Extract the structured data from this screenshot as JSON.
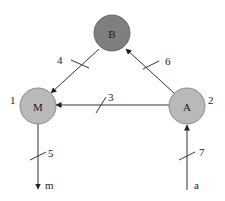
{
  "colors": {
    "node_dark": "#7f7f7f",
    "node_light": "#b9b9b9",
    "stroke": "#333333",
    "background": "#ffffff"
  },
  "nodes": {
    "B": {
      "label": "B",
      "index": ""
    },
    "M": {
      "label": "M",
      "index": "1"
    },
    "A": {
      "label": "A",
      "index": "2"
    }
  },
  "edges": {
    "e4": {
      "from": "B",
      "to": "M",
      "label": "4"
    },
    "e6": {
      "from": "A",
      "to": "B",
      "label": "6"
    },
    "e3": {
      "from": "A",
      "to": "M",
      "label": "3"
    },
    "e5": {
      "from": "M",
      "to": "m",
      "label": "5"
    },
    "e7": {
      "from": "a",
      "to": "A",
      "label": "7"
    }
  },
  "terminals": {
    "m": "m",
    "a": "a"
  }
}
